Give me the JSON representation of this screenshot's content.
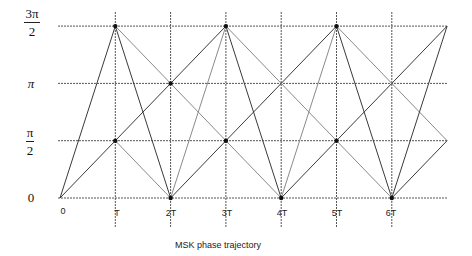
{
  "diagram": {
    "caption": "MSK phase trajectory",
    "y_axis_labels": [
      {
        "id": "zero",
        "text": "0",
        "type": "plain",
        "value": 0
      },
      {
        "id": "pi-half",
        "numerator": "π",
        "denominator": "2",
        "type": "fraction",
        "value": 1
      },
      {
        "id": "pi",
        "text": "π",
        "type": "pi",
        "value": 2
      },
      {
        "id": "three-pi-half",
        "numerator": "3π",
        "denominator": "2",
        "type": "fraction",
        "value": 3
      }
    ],
    "x_axis_labels": [
      "0",
      "T",
      "2T",
      "3T",
      "4T",
      "5T",
      "6T"
    ],
    "grid": {
      "x_origin_px": 60,
      "x_step_px": 55.3,
      "x_count": 7,
      "y_origin_px": 198,
      "y_step_px": 57.3,
      "y_levels": 3,
      "h_line_start_px": 58,
      "h_line_end_px": 447,
      "v_line_top_px": 12,
      "v_line_bottom_px": 228
    },
    "colors": {
      "grid": "#555555",
      "line_dark": "#3a3a3a",
      "line_light": "#8a8a8a",
      "dot": "#111111"
    },
    "trajectory_segments": [
      {
        "from": [
          0,
          0
        ],
        "to": [
          3,
          3
        ],
        "shade": "dark"
      },
      {
        "from": [
          0,
          0
        ],
        "to": [
          1,
          3
        ],
        "shade": "dark"
      },
      {
        "from": [
          1,
          3
        ],
        "to": [
          2,
          0
        ],
        "shade": "dark"
      },
      {
        "from": [
          1,
          3
        ],
        "to": [
          4,
          0
        ],
        "shade": "light"
      },
      {
        "from": [
          1,
          1
        ],
        "to": [
          2,
          0
        ],
        "shade": "light"
      },
      {
        "from": [
          2,
          0
        ],
        "to": [
          5,
          3
        ],
        "shade": "dark"
      },
      {
        "from": [
          2,
          0
        ],
        "to": [
          3,
          3
        ],
        "shade": "light"
      },
      {
        "from": [
          3,
          3
        ],
        "to": [
          4,
          0
        ],
        "shade": "dark"
      },
      {
        "from": [
          3,
          3
        ],
        "to": [
          6,
          0
        ],
        "shade": "light"
      },
      {
        "from": [
          4,
          0
        ],
        "to": [
          7,
          3
        ],
        "shade": "dark"
      },
      {
        "from": [
          4,
          0
        ],
        "to": [
          5,
          3
        ],
        "shade": "light"
      },
      {
        "from": [
          5,
          3
        ],
        "to": [
          6,
          0
        ],
        "shade": "dark"
      },
      {
        "from": [
          5,
          3
        ],
        "to": [
          7,
          1
        ],
        "shade": "light"
      },
      {
        "from": [
          6,
          0
        ],
        "to": [
          7,
          3
        ],
        "shade": "dark"
      },
      {
        "from": [
          6,
          0
        ],
        "to": [
          7,
          1
        ],
        "shade": "dark"
      }
    ],
    "nodes": [
      [
        1,
        3
      ],
      [
        1,
        1
      ],
      [
        2,
        0
      ],
      [
        2,
        2
      ],
      [
        3,
        3
      ],
      [
        3,
        1
      ],
      [
        4,
        0
      ],
      [
        5,
        3
      ],
      [
        5,
        1
      ],
      [
        6,
        0
      ]
    ]
  }
}
